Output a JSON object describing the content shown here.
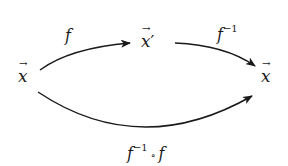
{
  "diagram": {
    "nodes": [
      {
        "id": "x_left",
        "symbol": "x",
        "decoration": "vector-arrow",
        "prime": ""
      },
      {
        "id": "x_prime",
        "symbol": "x",
        "decoration": "vector-arrow",
        "prime": "′"
      },
      {
        "id": "x_right",
        "symbol": "x",
        "decoration": "vector-arrow",
        "prime": ""
      }
    ],
    "edges": [
      {
        "from": "x_left",
        "to": "x_prime",
        "label": {
          "base": "f",
          "sup": ""
        }
      },
      {
        "from": "x_prime",
        "to": "x_right",
        "label": {
          "base": "f",
          "sup": "−1"
        }
      },
      {
        "from": "x_left",
        "to": "x_right",
        "label": {
          "base": "f",
          "sup": "−1",
          "op": "∘",
          "tail": "f"
        }
      }
    ],
    "colors": {
      "stroke": "#1a1a1a",
      "background": "#ffffff"
    }
  }
}
